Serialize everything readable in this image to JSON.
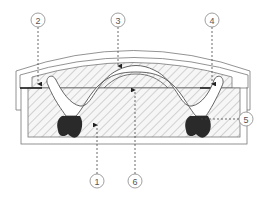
{
  "diagram": {
    "type": "cross-section",
    "colors": {
      "outline": "#666666",
      "hatch": "#bbbbbb",
      "fill_light": "#f4f4f4",
      "dark_region": "#2a2a2a",
      "callout_stroke": "#888888",
      "callout_text": "#555555"
    },
    "callouts": [
      {
        "id": 1,
        "label": "1",
        "x": 97,
        "y": 181
      },
      {
        "id": 2,
        "label": "2",
        "x": 38,
        "y": 20
      },
      {
        "id": 3,
        "label": "3",
        "x": 118,
        "y": 20
      },
      {
        "id": 4,
        "label": "4",
        "x": 212,
        "y": 20
      },
      {
        "id": 5,
        "label": "5",
        "x": 246,
        "y": 119
      },
      {
        "id": 6,
        "label": "6",
        "x": 135,
        "y": 181
      }
    ]
  }
}
